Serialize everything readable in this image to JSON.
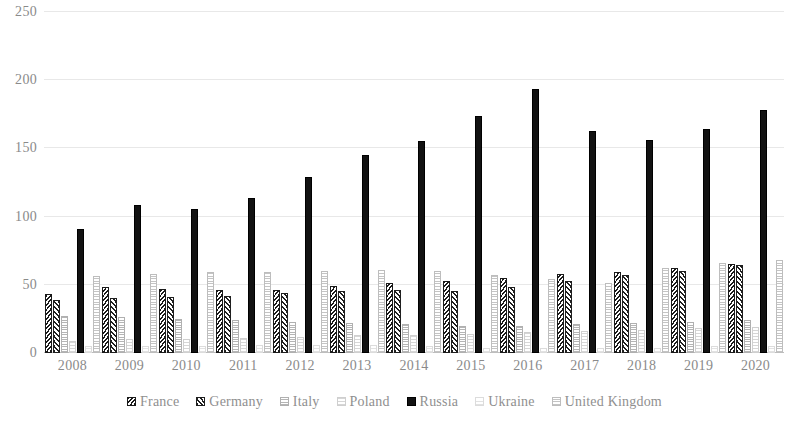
{
  "chart_data": {
    "type": "bar",
    "title": "",
    "subtitle": "",
    "xlabel": "",
    "ylabel": "",
    "ylim": [
      0,
      250
    ],
    "ytick_values": [
      0,
      50,
      100,
      150,
      200,
      250
    ],
    "ytick_labels": [
      "0",
      "50",
      "100",
      "150",
      "200",
      "250"
    ],
    "grid": true,
    "grid_axis": "y",
    "legend_position": "bottom",
    "categories": [
      "2008",
      "2009",
      "2010",
      "2011",
      "2012",
      "2013",
      "2014",
      "2015",
      "2016",
      "2017",
      "2018",
      "2019",
      "2020"
    ],
    "series": [
      {
        "name": "France",
        "color": "#1a1a1a",
        "pattern": "diagonal-hatch-dark",
        "values": [
          43,
          48,
          47,
          46,
          46,
          49,
          51,
          53,
          55,
          58,
          59,
          62,
          65
        ]
      },
      {
        "name": "Germany",
        "color": "#1f1f1f",
        "pattern": "diagonal-hatch",
        "values": [
          39,
          40,
          41,
          42,
          44,
          45,
          46,
          45,
          48,
          53,
          57,
          60,
          64
        ]
      },
      {
        "name": "Italy",
        "color": "#b5b5b5",
        "pattern": "grid-hatch-light",
        "values": [
          27,
          26,
          25,
          24,
          23,
          22,
          21,
          20,
          20,
          21,
          22,
          23,
          24
        ]
      },
      {
        "name": "Poland",
        "color": "#d6d6d6",
        "pattern": "horizontal-hatch-very-light",
        "values": [
          9,
          10,
          10,
          11,
          12,
          13,
          13,
          14,
          15,
          16,
          17,
          18,
          19
        ]
      },
      {
        "name": "Russia",
        "color": "#121212",
        "pattern": "solid",
        "values": [
          91,
          108,
          105,
          113,
          129,
          145,
          155,
          173,
          193,
          162,
          156,
          164,
          178
        ]
      },
      {
        "name": "Ukraine",
        "color": "#e2e2e2",
        "pattern": "horizontal-hatch-very-light",
        "values": [
          5,
          5,
          5,
          6,
          6,
          6,
          5,
          4,
          4,
          4,
          4,
          5,
          5
        ]
      },
      {
        "name": "United Kingdom",
        "color": "#c4c4c4",
        "pattern": "grid-hatch",
        "values": [
          56,
          58,
          59,
          59,
          60,
          61,
          60,
          57,
          54,
          51,
          62,
          66,
          68
        ]
      }
    ]
  }
}
